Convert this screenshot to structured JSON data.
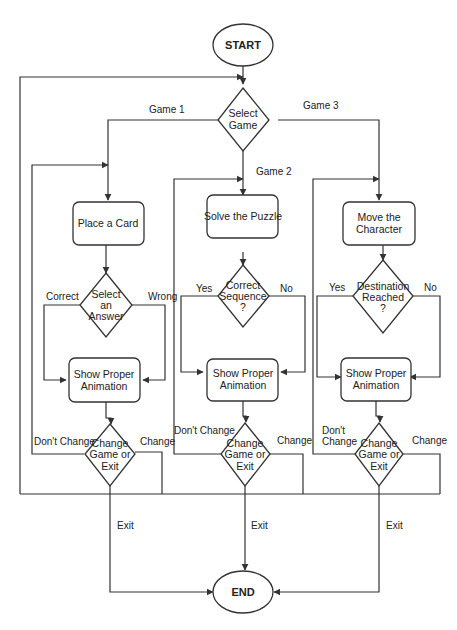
{
  "header": {
    "text": ""
  },
  "diagram": {
    "type": "flowchart",
    "colors": {
      "stroke": "#333333",
      "fill": "#ffffff",
      "text": "#222222"
    },
    "terminals": {
      "start": {
        "label": "START"
      },
      "end": {
        "label": "END"
      }
    },
    "select_game": {
      "lines": [
        "Select",
        "Game"
      ]
    },
    "games": [
      {
        "branch_label": "Game 1",
        "action": {
          "lines": [
            "Place a Card"
          ]
        },
        "decision": {
          "lines": [
            "Select",
            "an",
            "Answer"
          ]
        },
        "decision_left_label": "Correct",
        "decision_right_label": "Wrong",
        "animation": {
          "lines": [
            "Show Proper",
            "Animation"
          ]
        },
        "change": {
          "lines": [
            "Change",
            "Game or",
            "Exit"
          ]
        },
        "dont_change_label": [
          "Don't Change"
        ],
        "change_label": "Change",
        "exit_label": "Exit"
      },
      {
        "branch_label": "Game 2",
        "action": {
          "lines": [
            "Solve the Puzzle"
          ]
        },
        "decision": {
          "lines": [
            "Correct",
            "Sequence",
            "?"
          ]
        },
        "decision_left_label": "Yes",
        "decision_right_label": "No",
        "animation": {
          "lines": [
            "Show Proper",
            "Animation"
          ]
        },
        "change": {
          "lines": [
            "Change",
            "Game or",
            "Exit"
          ]
        },
        "dont_change_label": [
          "Don't Change"
        ],
        "change_label": "Change",
        "exit_label": "Exit"
      },
      {
        "branch_label": "Game 3",
        "action": {
          "lines": [
            "Move the",
            "Character"
          ]
        },
        "decision": {
          "lines": [
            "Destination",
            "Reached",
            "?"
          ]
        },
        "decision_left_label": "Yes",
        "decision_right_label": "No",
        "animation": {
          "lines": [
            "Show Proper",
            "Animation"
          ]
        },
        "change": {
          "lines": [
            "Change",
            "Game or",
            "Exit"
          ]
        },
        "dont_change_label": [
          "Don't",
          "Change"
        ],
        "change_label": "Change",
        "exit_label": "Exit"
      }
    ]
  }
}
